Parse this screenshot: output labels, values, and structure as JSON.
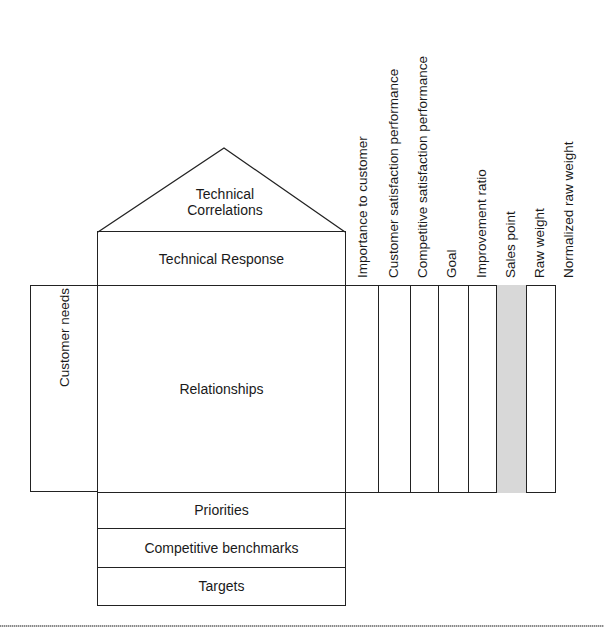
{
  "diagram": {
    "type": "House of Quality (QFD)",
    "roof": {
      "label": "Technical Correlations"
    },
    "technical_response": {
      "label": "Technical Response"
    },
    "customer_needs": {
      "label": "Customer needs"
    },
    "relationships": {
      "label": "Relationships"
    },
    "bottom_rows": [
      {
        "label": "Priorities"
      },
      {
        "label": "Competitive benchmarks"
      },
      {
        "label": "Targets"
      }
    ],
    "planning_columns": [
      {
        "label": "Importance to customer",
        "shaded": false
      },
      {
        "label": "Customer satisfaction performance",
        "shaded": false
      },
      {
        "label": "Competitive satisfaction performance",
        "shaded": false
      },
      {
        "label": "Goal",
        "shaded": false
      },
      {
        "label": "Improvement ratio",
        "shaded": false
      },
      {
        "label": "Sales point",
        "shaded": true
      },
      {
        "label": "Raw weight",
        "shaded": false
      },
      {
        "label": "Normalized raw weight",
        "shaded": false
      }
    ]
  }
}
